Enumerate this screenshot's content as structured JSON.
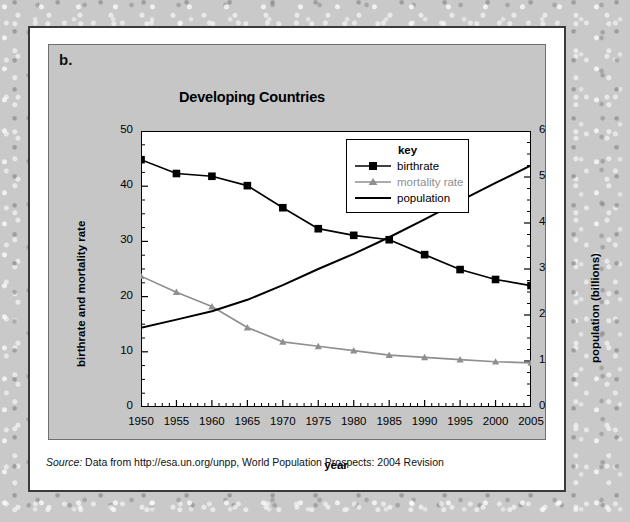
{
  "figure": {
    "panel_letter": "b.",
    "source_label": "Source:",
    "source_text": "Data from http://esa.un.org/unpp, World Population Prospects: 2004 Revision"
  },
  "legend": {
    "title": "key",
    "items": [
      {
        "label": "birthrate",
        "color": "#000000",
        "marker": "square"
      },
      {
        "label": "mortality rate",
        "color": "#8f8f8f",
        "marker": "triangle"
      },
      {
        "label": "population",
        "color": "#000000",
        "marker": "none"
      }
    ]
  },
  "chart_data": {
    "type": "line",
    "title": "Developing Countries",
    "xlabel": "year",
    "ylabel": "birthrate and mortality rate",
    "y2label": "population (billions)",
    "x": [
      1950,
      1955,
      1960,
      1965,
      1970,
      1975,
      1980,
      1985,
      1990,
      1995,
      2000,
      2005
    ],
    "xtick_labels": [
      "1950",
      "1955",
      "1960",
      "1965",
      "1970",
      "1975",
      "1980",
      "1985",
      "1990",
      "1995",
      "2000",
      "2005"
    ],
    "xlim": [
      1950,
      2005
    ],
    "ylim": [
      0,
      50
    ],
    "ytick_labels": [
      "0",
      "10",
      "20",
      "30",
      "40",
      "50"
    ],
    "ytick_values": [
      0,
      10,
      20,
      30,
      40,
      50
    ],
    "y2lim": [
      0,
      6
    ],
    "y2tick_labels": [
      "0",
      "1",
      "2",
      "3",
      "4",
      "5",
      "6"
    ],
    "y2tick_values": [
      0,
      1,
      2,
      3,
      4,
      5,
      6
    ],
    "grid": false,
    "legend_position": "top-center-inside",
    "minor_ticks": true,
    "series": [
      {
        "name": "birthrate",
        "axis": "left",
        "color": "#000000",
        "marker": "square",
        "values": [
          44.8,
          42.3,
          41.8,
          40.1,
          36.1,
          32.3,
          31.1,
          30.3,
          27.6,
          24.9,
          23.1,
          22.0
        ]
      },
      {
        "name": "mortality rate",
        "axis": "left",
        "color": "#8f8f8f",
        "marker": "triangle",
        "values": [
          23.7,
          20.8,
          18.2,
          14.4,
          11.8,
          11.0,
          10.2,
          9.4,
          9.0,
          8.6,
          8.2,
          8.0
        ]
      },
      {
        "name": "population",
        "axis": "right",
        "color": "#000000",
        "marker": "none",
        "values": [
          1.72,
          1.9,
          2.08,
          2.33,
          2.65,
          3.0,
          3.33,
          3.69,
          4.08,
          4.48,
          4.87,
          5.25
        ]
      }
    ]
  }
}
